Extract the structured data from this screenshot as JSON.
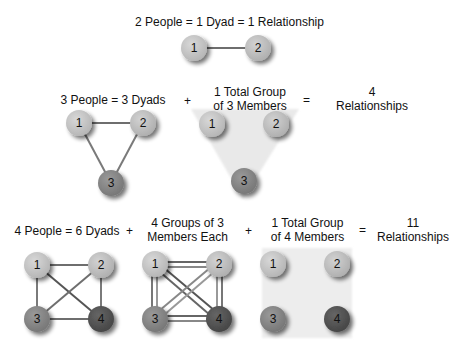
{
  "row1": {
    "title": "2 People = 1 Dyad = 1 Relationship",
    "nodes": [
      "1",
      "2"
    ]
  },
  "row2": {
    "dyads_label": "3 People = 3 Dyads",
    "plus": "+",
    "group_label_line1": "1 Total Group",
    "group_label_line2": "of 3 Members",
    "equals": "=",
    "result_line1": "4",
    "result_line2": "Relationships",
    "nodes": [
      "1",
      "2",
      "3"
    ]
  },
  "row3": {
    "dyads_label": "4 People = 6 Dyads",
    "plus1": "+",
    "groups_label_line1": "4 Groups of 3",
    "groups_label_line2": "Members Each",
    "plus2": "+",
    "total_label_line1": "1 Total Group",
    "total_label_line2": "of 4 Members",
    "equals": "=",
    "result_line1": "11",
    "result_line2": "Relationships",
    "nodes": [
      "1",
      "2",
      "3",
      "4"
    ]
  },
  "colors": {
    "node1": "#c4c4c4",
    "node2": "#bebebe",
    "node3": "#8a8a8a",
    "node4": "#555555",
    "edge": "#7a7a7a",
    "group_fill": "#ececec"
  }
}
